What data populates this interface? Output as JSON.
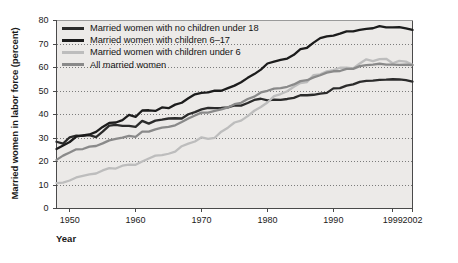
{
  "chart_data": {
    "type": "line",
    "title": "",
    "xlabel": "Year",
    "ylabel": "Married women in labor force (percent)",
    "xlim": [
      1948,
      2002
    ],
    "ylim": [
      0,
      80
    ],
    "grid": true,
    "legend_position": "top-left",
    "xticks": [
      {
        "value": 1950,
        "label": "1950"
      },
      {
        "value": 1960,
        "label": "1960"
      },
      {
        "value": 1970,
        "label": "1970"
      },
      {
        "value": 1980,
        "label": "1980"
      },
      {
        "value": 1990,
        "label": "1990"
      },
      {
        "value": 1999,
        "label": "1999"
      },
      {
        "value": 2002,
        "label": "2002"
      }
    ],
    "yticks": [
      {
        "value": 0,
        "label": "0"
      },
      {
        "value": 10,
        "label": "10"
      },
      {
        "value": 20,
        "label": "20"
      },
      {
        "value": 30,
        "label": "30"
      },
      {
        "value": 40,
        "label": "40"
      },
      {
        "value": 50,
        "label": "50"
      },
      {
        "value": 60,
        "label": "60"
      },
      {
        "value": 70,
        "label": "70"
      },
      {
        "value": 80,
        "label": "80"
      }
    ],
    "x": [
      1948,
      1949,
      1950,
      1951,
      1952,
      1953,
      1954,
      1955,
      1956,
      1957,
      1958,
      1959,
      1960,
      1961,
      1962,
      1963,
      1964,
      1965,
      1966,
      1967,
      1968,
      1969,
      1970,
      1971,
      1972,
      1973,
      1974,
      1975,
      1976,
      1977,
      1978,
      1979,
      1980,
      1981,
      1982,
      1983,
      1984,
      1985,
      1986,
      1987,
      1988,
      1989,
      1990,
      1991,
      1992,
      1993,
      1994,
      1995,
      1996,
      1997,
      1998,
      1999,
      2000,
      2001,
      2002
    ],
    "series": [
      {
        "name": "Married women with no children under 18",
        "color": "#2b2b2b",
        "values": [
          28.4,
          27.6,
          30.3,
          31.0,
          30.9,
          31.2,
          30.4,
          32.7,
          35.3,
          35.6,
          35.2,
          35.2,
          34.7,
          37.3,
          36.1,
          37.4,
          37.8,
          38.3,
          38.4,
          38.3,
          40.1,
          41.0,
          42.2,
          42.8,
          42.7,
          42.8,
          43.0,
          43.9,
          43.8,
          44.9,
          46.2,
          46.7,
          46.0,
          46.3,
          46.2,
          46.6,
          47.1,
          48.2,
          48.2,
          48.4,
          48.9,
          49.2,
          51.1,
          51.2,
          52.3,
          52.8,
          53.9,
          54.3,
          54.4,
          54.7,
          54.8,
          55.0,
          54.9,
          54.6,
          54.0
        ]
      },
      {
        "name": "Married women with children 6–17",
        "color": "#1c1c1c",
        "values": [
          25.3,
          26.8,
          28.3,
          30.6,
          31.1,
          31.5,
          32.6,
          34.7,
          36.4,
          36.6,
          37.6,
          39.8,
          39.0,
          41.7,
          41.8,
          41.5,
          43.0,
          42.7,
          44.2,
          45.0,
          46.9,
          48.6,
          49.2,
          49.4,
          50.2,
          50.1,
          51.2,
          52.3,
          53.7,
          55.6,
          57.2,
          59.1,
          61.7,
          62.5,
          63.2,
          63.8,
          65.4,
          67.8,
          68.4,
          70.6,
          72.5,
          73.2,
          73.6,
          74.4,
          75.4,
          75.4,
          76.0,
          76.4,
          76.7,
          77.6,
          77.1,
          77.1,
          77.2,
          76.6,
          76.0
        ]
      },
      {
        "name": "Married women with children under 6",
        "color": "#bdbdbd",
        "values": [
          10.8,
          11.0,
          11.9,
          13.2,
          13.9,
          14.5,
          14.9,
          16.2,
          17.2,
          17.0,
          18.2,
          18.7,
          18.6,
          20.0,
          21.3,
          22.5,
          22.7,
          23.3,
          24.2,
          26.5,
          27.6,
          28.5,
          30.3,
          29.6,
          30.1,
          32.7,
          34.4,
          36.6,
          37.4,
          39.3,
          41.6,
          43.2,
          45.1,
          47.8,
          48.7,
          49.9,
          51.8,
          53.4,
          53.8,
          56.8,
          57.1,
          58.4,
          58.9,
          59.9,
          59.9,
          59.6,
          61.7,
          63.5,
          62.7,
          63.6,
          63.7,
          61.8,
          62.8,
          62.5,
          61.2
        ]
      },
      {
        "name": "All married women",
        "color": "#8a8a8a",
        "values": [
          20.7,
          22.5,
          23.8,
          25.2,
          25.3,
          26.3,
          26.6,
          27.7,
          29.0,
          29.6,
          30.2,
          30.9,
          30.5,
          32.7,
          32.7,
          33.7,
          34.4,
          34.7,
          35.4,
          36.8,
          38.3,
          39.6,
          40.8,
          40.8,
          41.5,
          42.2,
          43.0,
          44.4,
          45.0,
          46.6,
          47.6,
          49.4,
          50.1,
          51.0,
          51.2,
          51.8,
          52.8,
          54.2,
          54.6,
          55.8,
          56.7,
          57.8,
          58.4,
          58.5,
          59.4,
          59.4,
          60.6,
          61.0,
          61.2,
          61.6,
          61.2,
          61.2,
          61.1,
          61.2,
          61.0
        ]
      }
    ]
  },
  "legend": {
    "items": [
      {
        "label": "Married women with no children under 18",
        "color": "#2b2b2b"
      },
      {
        "label": "Married women with children 6–17",
        "color": "#1c1c1c"
      },
      {
        "label": "Married women with children under 6",
        "color": "#bdbdbd"
      },
      {
        "label": "All married women",
        "color": "#8a8a8a"
      }
    ]
  },
  "style": {
    "plot_background": "#eceae8",
    "grid_color": "#6f6f6f",
    "axis_color": "#4a4a4a",
    "text_color": "#1a1a1a"
  }
}
